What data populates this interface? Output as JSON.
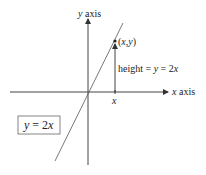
{
  "diagram": {
    "y_axis_label": "y axis",
    "x_axis_label": "x axis",
    "point_label": "(x,y)",
    "height_label": "height = y = 2x",
    "x_tick_label": "x",
    "equation_box": "y = 2x",
    "colors": {
      "ink": "#333333",
      "line": "#555555",
      "box": "#666666"
    }
  }
}
